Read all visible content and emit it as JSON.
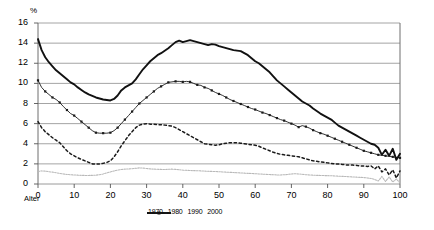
{
  "chart_data": {
    "type": "line",
    "title": "",
    "subtitle": "",
    "xlabel": "Alter",
    "ylabel": "%",
    "unit_label": "%",
    "xlim": [
      0,
      100
    ],
    "ylim": [
      0,
      16
    ],
    "ytick_step": 2,
    "xtick_step": 10,
    "yticks": [
      "16",
      "14",
      "12",
      "10",
      "8",
      "6",
      "4",
      "2",
      "0"
    ],
    "xticks": [
      "0",
      "10",
      "20",
      "30",
      "40",
      "50",
      "60",
      "70",
      "80",
      "90",
      "100"
    ],
    "grid": "horizontal",
    "legend_position": "bottom",
    "colors": {
      "s1970": "#b9b9b9",
      "s1980": "#1a1a1a",
      "s1990": "#1a1a1a",
      "s2000": "#111111",
      "grid": "#9a9a9a",
      "axis": "#555555",
      "border": "#6f6f6f"
    },
    "x": [
      0,
      1,
      2,
      3,
      4,
      5,
      6,
      7,
      8,
      9,
      10,
      11,
      12,
      13,
      14,
      15,
      16,
      17,
      18,
      19,
      20,
      21,
      22,
      23,
      24,
      25,
      26,
      27,
      28,
      29,
      30,
      31,
      32,
      33,
      34,
      35,
      36,
      37,
      38,
      39,
      40,
      41,
      42,
      43,
      44,
      45,
      46,
      47,
      48,
      49,
      50,
      51,
      52,
      53,
      54,
      55,
      56,
      57,
      58,
      59,
      60,
      61,
      62,
      63,
      64,
      65,
      66,
      67,
      68,
      69,
      70,
      71,
      72,
      73,
      74,
      75,
      76,
      77,
      78,
      79,
      80,
      81,
      82,
      83,
      84,
      85,
      86,
      87,
      88,
      89,
      90,
      91,
      92,
      93,
      94,
      95,
      96,
      97,
      98,
      99,
      100
    ],
    "series": [
      {
        "name": "1970",
        "style": "thin-light-line",
        "values": [
          1.25,
          1.3,
          1.28,
          1.22,
          1.18,
          1.12,
          1.05,
          1.0,
          0.95,
          0.92,
          0.9,
          0.88,
          0.86,
          0.85,
          0.85,
          0.86,
          0.88,
          0.92,
          1.0,
          1.1,
          1.2,
          1.3,
          1.38,
          1.44,
          1.48,
          1.5,
          1.52,
          1.56,
          1.6,
          1.58,
          1.54,
          1.5,
          1.48,
          1.46,
          1.45,
          1.44,
          1.46,
          1.48,
          1.45,
          1.42,
          1.38,
          1.36,
          1.34,
          1.33,
          1.32,
          1.3,
          1.28,
          1.26,
          1.25,
          1.24,
          1.22,
          1.2,
          1.18,
          1.16,
          1.14,
          1.12,
          1.1,
          1.08,
          1.06,
          1.04,
          1.02,
          1.0,
          0.98,
          0.96,
          0.94,
          0.92,
          0.9,
          0.9,
          0.92,
          0.95,
          1.0,
          1.02,
          1.0,
          0.96,
          0.92,
          0.9,
          0.88,
          0.86,
          0.85,
          0.84,
          0.83,
          0.82,
          0.8,
          0.78,
          0.76,
          0.74,
          0.72,
          0.7,
          0.68,
          0.66,
          0.64,
          0.6,
          0.55,
          0.45,
          0.3,
          0.75,
          0.25,
          0.7,
          0.2,
          0.5,
          0.1
        ]
      },
      {
        "name": "1980",
        "style": "dashed",
        "values": [
          6.2,
          5.6,
          5.2,
          4.9,
          4.6,
          4.35,
          4.1,
          3.7,
          3.3,
          3.0,
          2.8,
          2.6,
          2.45,
          2.3,
          2.15,
          2.0,
          1.98,
          2.0,
          2.05,
          2.15,
          2.3,
          2.7,
          3.2,
          3.8,
          4.3,
          4.8,
          5.2,
          5.6,
          5.85,
          5.95,
          6.0,
          5.95,
          5.95,
          5.9,
          5.9,
          5.85,
          5.8,
          5.75,
          5.6,
          5.4,
          5.2,
          5.0,
          4.8,
          4.6,
          4.4,
          4.2,
          4.0,
          3.95,
          3.9,
          3.85,
          3.9,
          4.0,
          4.05,
          4.1,
          4.1,
          4.1,
          4.05,
          4.0,
          3.95,
          3.9,
          3.85,
          3.75,
          3.6,
          3.45,
          3.3,
          3.15,
          3.05,
          2.95,
          2.9,
          2.85,
          2.8,
          2.75,
          2.7,
          2.6,
          2.5,
          2.4,
          2.3,
          2.25,
          2.2,
          2.15,
          2.1,
          2.05,
          2.0,
          1.98,
          1.95,
          1.9,
          1.9,
          1.88,
          1.85,
          1.8,
          1.8,
          1.75,
          1.8,
          1.5,
          1.8,
          1.2,
          1.5,
          0.9,
          1.4,
          0.6,
          1.3
        ]
      },
      {
        "name": "1990",
        "style": "marker-line",
        "values": [
          10.3,
          9.6,
          9.2,
          8.9,
          8.6,
          8.4,
          8.1,
          7.7,
          7.35,
          7.0,
          6.8,
          6.5,
          6.2,
          5.9,
          5.6,
          5.3,
          5.1,
          5.05,
          5.05,
          5.05,
          5.1,
          5.3,
          5.6,
          6.0,
          6.4,
          6.8,
          7.2,
          7.6,
          8.0,
          8.3,
          8.6,
          8.9,
          9.2,
          9.5,
          9.7,
          9.9,
          10.1,
          10.15,
          10.2,
          10.2,
          10.15,
          10.2,
          10.15,
          10.0,
          9.85,
          9.8,
          9.6,
          9.5,
          9.3,
          9.1,
          8.95,
          8.8,
          8.6,
          8.4,
          8.25,
          8.1,
          7.95,
          7.8,
          7.65,
          7.5,
          7.4,
          7.25,
          7.1,
          7.0,
          6.85,
          6.7,
          6.55,
          6.4,
          6.3,
          6.15,
          6.0,
          5.85,
          5.65,
          5.8,
          5.7,
          5.55,
          5.35,
          5.2,
          5.05,
          4.95,
          4.8,
          4.65,
          4.5,
          4.35,
          4.2,
          4.05,
          3.9,
          3.75,
          3.6,
          3.45,
          3.3,
          3.2,
          3.1,
          3.0,
          2.9,
          2.85,
          2.8,
          2.75,
          2.7,
          2.65,
          2.6
        ]
      },
      {
        "name": "2000",
        "style": "thick-line",
        "values": [
          14.4,
          13.3,
          12.6,
          12.1,
          11.7,
          11.3,
          11.0,
          10.7,
          10.4,
          10.1,
          9.9,
          9.6,
          9.35,
          9.1,
          8.9,
          8.75,
          8.6,
          8.5,
          8.4,
          8.35,
          8.3,
          8.45,
          8.8,
          9.3,
          9.6,
          9.8,
          10.0,
          10.4,
          10.9,
          11.4,
          11.8,
          12.2,
          12.5,
          12.8,
          13.0,
          13.25,
          13.5,
          13.8,
          14.1,
          14.25,
          14.1,
          14.2,
          14.3,
          14.2,
          14.1,
          14.0,
          13.9,
          13.8,
          13.9,
          13.85,
          13.7,
          13.6,
          13.5,
          13.4,
          13.3,
          13.25,
          13.2,
          13.0,
          12.8,
          12.5,
          12.2,
          12.0,
          11.7,
          11.4,
          11.1,
          10.7,
          10.3,
          10.0,
          9.7,
          9.4,
          9.1,
          8.8,
          8.5,
          8.2,
          8.0,
          7.8,
          7.5,
          7.25,
          7.0,
          6.8,
          6.6,
          6.4,
          6.1,
          5.8,
          5.6,
          5.4,
          5.2,
          5.0,
          4.8,
          4.6,
          4.4,
          4.2,
          4.0,
          3.9,
          3.6,
          2.9,
          3.4,
          2.8,
          3.5,
          2.4,
          3.0
        ]
      }
    ]
  },
  "axis": {
    "unit": "%",
    "x_name": "Alter"
  },
  "legend": {
    "items": [
      {
        "label": "1970",
        "key": "s1970"
      },
      {
        "label": "1980",
        "key": "s1980"
      },
      {
        "label": "1990",
        "key": "s1990"
      },
      {
        "label": "2000",
        "key": "s2000"
      }
    ]
  }
}
